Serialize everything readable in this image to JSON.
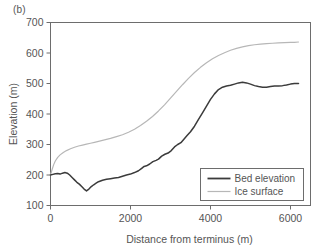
{
  "panel": {
    "label": "(b)"
  },
  "colors": {
    "bed_line": "#3b3b3b",
    "ice_line": "#b7b7b7",
    "axis": "#6d6d6d",
    "text": "#555555",
    "background": "#ffffff"
  },
  "chart_data": {
    "type": "line",
    "title": "",
    "subtitle": "",
    "xlabel": "Distance from terminus (m)",
    "ylabel": "Elevation (m)",
    "xlim": [
      0,
      6500
    ],
    "ylim": [
      100,
      700
    ],
    "xticks": [
      0,
      2000,
      4000,
      6000
    ],
    "xtick_labels": [
      "0",
      "2000",
      "4000",
      "6000"
    ],
    "yticks": [
      100,
      200,
      300,
      400,
      500,
      600,
      700
    ],
    "ytick_labels": [
      "100",
      "200",
      "300",
      "400",
      "500",
      "600",
      "700"
    ],
    "grid": false,
    "legend_position": "lower right",
    "series": [
      {
        "name": "Bed elevation",
        "color": "#3b3b3b",
        "x": [
          0,
          60,
          120,
          180,
          240,
          300,
          360,
          420,
          480,
          540,
          600,
          660,
          720,
          780,
          840,
          900,
          960,
          1020,
          1080,
          1140,
          1200,
          1300,
          1400,
          1500,
          1600,
          1700,
          1800,
          1900,
          2000,
          2100,
          2200,
          2280,
          2340,
          2400,
          2480,
          2560,
          2640,
          2700,
          2780,
          2860,
          2940,
          3020,
          3100,
          3180,
          3260,
          3340,
          3420,
          3500,
          3600,
          3700,
          3800,
          3900,
          4000,
          4100,
          4200,
          4300,
          4400,
          4500,
          4600,
          4700,
          4800,
          4900,
          5000,
          5100,
          5200,
          5300,
          5400,
          5500,
          5600,
          5700,
          5800,
          5900,
          6000,
          6100,
          6200
        ],
        "y": [
          200,
          202,
          204,
          205,
          203,
          206,
          208,
          206,
          200,
          192,
          184,
          176,
          170,
          162,
          154,
          148,
          154,
          162,
          168,
          173,
          178,
          183,
          186,
          188,
          190,
          192,
          196,
          200,
          203,
          208,
          214,
          222,
          228,
          230,
          236,
          244,
          248,
          252,
          262,
          268,
          272,
          280,
          292,
          300,
          306,
          318,
          330,
          342,
          360,
          382,
          404,
          426,
          448,
          466,
          480,
          488,
          492,
          494,
          498,
          502,
          504,
          502,
          498,
          493,
          490,
          488,
          488,
          490,
          492,
          492,
          493,
          495,
          498,
          500,
          500
        ]
      },
      {
        "name": "Ice surface",
        "color": "#b7b7b7",
        "x": [
          0,
          40,
          80,
          120,
          180,
          240,
          320,
          400,
          500,
          600,
          700,
          800,
          900,
          1000,
          1100,
          1200,
          1350,
          1500,
          1650,
          1800,
          1950,
          2100,
          2250,
          2400,
          2550,
          2700,
          2850,
          3000,
          3150,
          3300,
          3450,
          3600,
          3750,
          3900,
          4050,
          4200,
          4350,
          4500,
          4650,
          4800,
          4950,
          5100,
          5250,
          5400,
          5550,
          5700,
          5850,
          6000,
          6100,
          6200
        ],
        "y": [
          200,
          218,
          234,
          246,
          258,
          266,
          274,
          280,
          286,
          291,
          295,
          298,
          301,
          304,
          307,
          310,
          315,
          320,
          326,
          332,
          340,
          350,
          362,
          376,
          392,
          410,
          430,
          452,
          474,
          496,
          517,
          536,
          553,
          568,
          581,
          592,
          601,
          609,
          615,
          620,
          624,
          627,
          629,
          631,
          632,
          633,
          634,
          635,
          635,
          636
        ]
      }
    ]
  },
  "legend": {
    "items": [
      {
        "label": "Bed elevation"
      },
      {
        "label": "Ice surface"
      }
    ]
  }
}
